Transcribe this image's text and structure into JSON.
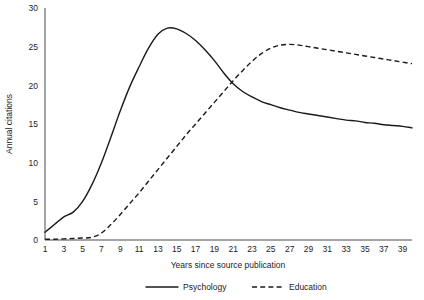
{
  "chart_data": {
    "type": "line",
    "title": "",
    "xlabel": "Years since source publication",
    "ylabel": "Annual citations",
    "xlim": [
      1,
      40
    ],
    "ylim": [
      0,
      30
    ],
    "grid": false,
    "legend_position": "bottom",
    "xticks": [
      1,
      3,
      5,
      7,
      9,
      11,
      13,
      15,
      17,
      19,
      21,
      23,
      25,
      27,
      29,
      31,
      33,
      35,
      37,
      39
    ],
    "yticks": [
      0,
      5,
      10,
      15,
      20,
      25,
      30
    ],
    "x": [
      1,
      2,
      3,
      4,
      5,
      6,
      7,
      8,
      9,
      10,
      11,
      12,
      13,
      14,
      15,
      16,
      17,
      18,
      19,
      20,
      21,
      22,
      23,
      24,
      25,
      26,
      27,
      28,
      29,
      30,
      31,
      32,
      33,
      34,
      35,
      36,
      37,
      38,
      39,
      40
    ],
    "series": [
      {
        "name": "Psychology",
        "style": "solid",
        "color": "#1a1a1a",
        "values": [
          1.0,
          2.0,
          3.0,
          3.6,
          5.0,
          7.2,
          10.0,
          13.3,
          16.7,
          19.8,
          22.4,
          24.8,
          26.6,
          27.4,
          27.3,
          26.7,
          25.8,
          24.6,
          23.2,
          21.6,
          20.2,
          19.2,
          18.5,
          17.9,
          17.5,
          17.1,
          16.8,
          16.5,
          16.3,
          16.1,
          15.9,
          15.7,
          15.5,
          15.4,
          15.2,
          15.1,
          14.9,
          14.8,
          14.7,
          14.5
        ]
      },
      {
        "name": "Education",
        "style": "dashed",
        "color": "#1a1a1a",
        "values": [
          0.1,
          0.1,
          0.15,
          0.2,
          0.25,
          0.35,
          0.9,
          2.0,
          3.3,
          4.7,
          6.1,
          7.6,
          9.1,
          10.6,
          12.1,
          13.6,
          15.0,
          16.4,
          17.8,
          19.2,
          20.6,
          21.9,
          23.1,
          24.1,
          24.8,
          25.2,
          25.3,
          25.2,
          25.0,
          24.8,
          24.6,
          24.4,
          24.2,
          24.0,
          23.8,
          23.6,
          23.4,
          23.2,
          23.0,
          22.8
        ]
      }
    ],
    "legend": [
      {
        "label": "Psychology",
        "style": "solid"
      },
      {
        "label": "Education",
        "style": "dashed"
      }
    ]
  }
}
